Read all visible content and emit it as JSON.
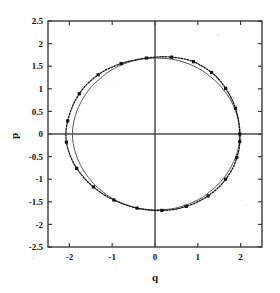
{
  "chart_data": {
    "type": "scatter",
    "title": "",
    "xlabel": "q",
    "ylabel": "p",
    "xlim": [
      -2.5,
      2.5
    ],
    "ylim": [
      -2.5,
      2.5
    ],
    "grid": false,
    "legend": "none",
    "xticks": [
      "-2",
      "-1",
      "0",
      "1",
      "2"
    ],
    "xtick_values": [
      -2,
      -1,
      0,
      1,
      2
    ],
    "yticks": [
      "2.5",
      "2",
      "1.5",
      "1",
      "0.5",
      "0",
      "-0.5",
      "-1",
      "-1.5",
      "-2",
      "-2.5"
    ],
    "ytick_values": [
      2.5,
      2,
      1.5,
      1,
      0.5,
      0,
      -0.5,
      -1,
      -1.5,
      -2,
      -2.5
    ],
    "axis_lines": {
      "x_zero": 0,
      "y_zero": 0
    },
    "series": [
      {
        "name": "numerical-trajectory",
        "style": "dotted-with-markers",
        "color": "#1a1a1a",
        "points": [
          [
            1.98,
            0.0
          ],
          [
            1.96,
            0.22
          ],
          [
            1.93,
            0.4
          ],
          [
            1.88,
            0.57
          ],
          [
            1.82,
            0.72
          ],
          [
            1.74,
            0.87
          ],
          [
            1.65,
            1.01
          ],
          [
            1.55,
            1.14
          ],
          [
            1.44,
            1.26
          ],
          [
            1.32,
            1.36
          ],
          [
            1.19,
            1.45
          ],
          [
            1.05,
            1.53
          ],
          [
            0.9,
            1.6
          ],
          [
            0.74,
            1.65
          ],
          [
            0.57,
            1.68
          ],
          [
            0.39,
            1.7
          ],
          [
            0.2,
            1.71
          ],
          [
            0.0,
            1.7
          ],
          [
            -0.2,
            1.68
          ],
          [
            -0.4,
            1.65
          ],
          [
            -0.6,
            1.61
          ],
          [
            -0.79,
            1.56
          ],
          [
            -0.98,
            1.49
          ],
          [
            -1.16,
            1.41
          ],
          [
            -1.33,
            1.31
          ],
          [
            -1.49,
            1.19
          ],
          [
            -1.64,
            1.05
          ],
          [
            -1.77,
            0.89
          ],
          [
            -1.88,
            0.71
          ],
          [
            -1.97,
            0.51
          ],
          [
            -2.04,
            0.29
          ],
          [
            -2.08,
            0.05
          ],
          [
            -2.07,
            -0.18
          ],
          [
            -2.01,
            -0.4
          ],
          [
            -1.93,
            -0.59
          ],
          [
            -1.83,
            -0.76
          ],
          [
            -1.71,
            -0.91
          ],
          [
            -1.58,
            -1.05
          ],
          [
            -1.44,
            -1.17
          ],
          [
            -1.29,
            -1.28
          ],
          [
            -1.13,
            -1.38
          ],
          [
            -0.96,
            -1.46
          ],
          [
            -0.79,
            -1.53
          ],
          [
            -0.61,
            -1.59
          ],
          [
            -0.42,
            -1.64
          ],
          [
            -0.23,
            -1.67
          ],
          [
            -0.04,
            -1.69
          ],
          [
            0.16,
            -1.69
          ],
          [
            0.35,
            -1.68
          ],
          [
            0.54,
            -1.65
          ],
          [
            0.73,
            -1.6
          ],
          [
            0.91,
            -1.54
          ],
          [
            1.08,
            -1.46
          ],
          [
            1.24,
            -1.37
          ],
          [
            1.39,
            -1.26
          ],
          [
            1.53,
            -1.14
          ],
          [
            1.65,
            -1.0
          ],
          [
            1.76,
            -0.85
          ],
          [
            1.85,
            -0.69
          ],
          [
            1.91,
            -0.52
          ],
          [
            1.96,
            -0.35
          ],
          [
            1.98,
            -0.17
          ],
          [
            1.98,
            0.0
          ]
        ]
      },
      {
        "name": "analytic-ellipse",
        "style": "solid",
        "color": "#555555",
        "points": [
          [
            1.99,
            0.0
          ],
          [
            1.97,
            0.21
          ],
          [
            1.92,
            0.41
          ],
          [
            1.84,
            0.61
          ],
          [
            1.74,
            0.79
          ],
          [
            1.61,
            0.97
          ],
          [
            1.46,
            1.13
          ],
          [
            1.29,
            1.27
          ],
          [
            1.11,
            1.4
          ],
          [
            0.91,
            1.5
          ],
          [
            0.7,
            1.58
          ],
          [
            0.48,
            1.64
          ],
          [
            0.26,
            1.67
          ],
          [
            0.03,
            1.68
          ],
          [
            -0.2,
            1.67
          ],
          [
            -0.42,
            1.64
          ],
          [
            -0.64,
            1.58
          ],
          [
            -0.85,
            1.5
          ],
          [
            -1.05,
            1.4
          ],
          [
            -1.23,
            1.27
          ],
          [
            -1.4,
            1.13
          ],
          [
            -1.55,
            0.97
          ],
          [
            -1.68,
            0.79
          ],
          [
            -1.78,
            0.61
          ],
          [
            -1.86,
            0.41
          ],
          [
            -1.91,
            0.21
          ],
          [
            -1.93,
            0.0
          ],
          [
            -1.91,
            -0.21
          ],
          [
            -1.86,
            -0.41
          ],
          [
            -1.78,
            -0.61
          ],
          [
            -1.68,
            -0.79
          ],
          [
            -1.55,
            -0.97
          ],
          [
            -1.4,
            -1.13
          ],
          [
            -1.23,
            -1.27
          ],
          [
            -1.05,
            -1.4
          ],
          [
            -0.85,
            -1.5
          ],
          [
            -0.64,
            -1.58
          ],
          [
            -0.42,
            -1.64
          ],
          [
            -0.2,
            -1.67
          ],
          [
            0.03,
            -1.68
          ],
          [
            0.26,
            -1.67
          ],
          [
            0.48,
            -1.64
          ],
          [
            0.7,
            -1.58
          ],
          [
            0.91,
            -1.5
          ],
          [
            1.11,
            -1.4
          ],
          [
            1.29,
            -1.27
          ],
          [
            1.46,
            -1.13
          ],
          [
            1.61,
            -0.97
          ],
          [
            1.74,
            -0.79
          ],
          [
            1.84,
            -0.61
          ],
          [
            1.92,
            -0.41
          ],
          [
            1.97,
            -0.21
          ],
          [
            1.99,
            0.0
          ]
        ]
      }
    ],
    "markers": [
      [
        1.98,
        0.0
      ],
      [
        1.88,
        0.57
      ],
      [
        1.65,
        1.01
      ],
      [
        1.32,
        1.36
      ],
      [
        0.9,
        1.6
      ],
      [
        0.39,
        1.7
      ],
      [
        -0.2,
        1.68
      ],
      [
        -0.79,
        1.56
      ],
      [
        -1.33,
        1.31
      ],
      [
        -1.77,
        0.89
      ],
      [
        -2.04,
        0.29
      ],
      [
        -2.07,
        -0.18
      ],
      [
        -1.83,
        -0.76
      ],
      [
        -1.44,
        -1.17
      ],
      [
        -0.96,
        -1.46
      ],
      [
        -0.42,
        -1.64
      ],
      [
        0.16,
        -1.69
      ],
      [
        0.73,
        -1.6
      ],
      [
        1.24,
        -1.37
      ],
      [
        1.65,
        -1.0
      ],
      [
        1.91,
        -0.52
      ],
      [
        1.98,
        -0.17
      ]
    ]
  },
  "axes": {
    "x_title": "q",
    "y_title": "p"
  }
}
